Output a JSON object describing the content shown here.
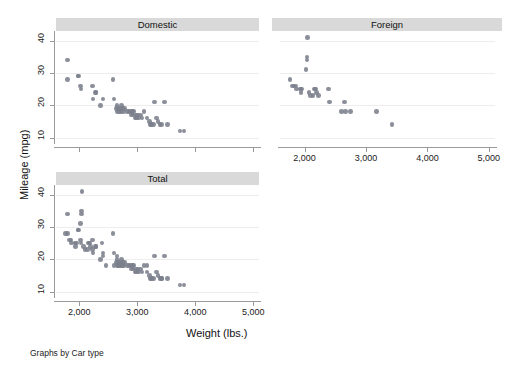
{
  "figure": {
    "y_axis_title": "Mileage (mpg)",
    "x_axis_title": "Weight (lbs.)",
    "note": "Graphs by Car type",
    "background_color": "#ffffff",
    "marker_color": "#7b7f8c",
    "panel_title_bg": "#d9d9d9",
    "axis_color": "#9a9a9a",
    "grid_color": "#ededed"
  },
  "panels": {
    "domestic": {
      "title": "Domestic"
    },
    "foreign": {
      "title": "Foreign"
    },
    "total": {
      "title": "Total"
    }
  },
  "axis_labels": {
    "y": [
      "10",
      "20",
      "30",
      "40"
    ],
    "x": [
      "2,000",
      "3,000",
      "4,000",
      "5,000"
    ]
  },
  "chart_data": {
    "type": "scatter",
    "title": "",
    "xlabel": "Weight (lbs.)",
    "ylabel": "Mileage (mpg)",
    "xlim": [
      1600,
      5100
    ],
    "ylim": [
      8,
      43
    ],
    "xticks": [
      2000,
      3000,
      4000,
      5000
    ],
    "yticks": [
      10,
      20,
      30,
      40
    ],
    "grid": "horizontal",
    "legend": "none",
    "note": "Graphs by Car type",
    "panel_variable": "Car type",
    "panels": [
      {
        "name": "Domestic",
        "points": [
          [
            1800,
            34
          ],
          [
            1800,
            28
          ],
          [
            1980,
            29
          ],
          [
            1990,
            29
          ],
          [
            2020,
            26
          ],
          [
            2030,
            25
          ],
          [
            2230,
            26
          ],
          [
            2240,
            22
          ],
          [
            2280,
            24
          ],
          [
            2290,
            24
          ],
          [
            2370,
            20
          ],
          [
            2410,
            22
          ],
          [
            2580,
            28
          ],
          [
            2600,
            22
          ],
          [
            2640,
            19
          ],
          [
            2650,
            20
          ],
          [
            2660,
            18
          ],
          [
            2670,
            19
          ],
          [
            2690,
            18
          ],
          [
            2700,
            19
          ],
          [
            2720,
            18
          ],
          [
            2730,
            20
          ],
          [
            2750,
            19
          ],
          [
            2760,
            18
          ],
          [
            2780,
            19
          ],
          [
            2830,
            18
          ],
          [
            2860,
            18
          ],
          [
            2890,
            18
          ],
          [
            2900,
            17
          ],
          [
            2920,
            18
          ],
          [
            2930,
            17
          ],
          [
            2940,
            18
          ],
          [
            2960,
            16
          ],
          [
            2980,
            17
          ],
          [
            2990,
            16
          ],
          [
            3010,
            17
          ],
          [
            3020,
            16
          ],
          [
            3060,
            17
          ],
          [
            3080,
            16
          ],
          [
            3120,
            18
          ],
          [
            3170,
            16
          ],
          [
            3210,
            15
          ],
          [
            3230,
            14
          ],
          [
            3250,
            14
          ],
          [
            3280,
            14
          ],
          [
            3300,
            21
          ],
          [
            3330,
            16
          ],
          [
            3360,
            15
          ],
          [
            3390,
            14
          ],
          [
            3420,
            14
          ],
          [
            3470,
            21
          ],
          [
            3520,
            14
          ],
          [
            3740,
            12
          ],
          [
            3810,
            12
          ]
        ]
      },
      {
        "name": "Foreign",
        "points": [
          [
            2050,
            41
          ],
          [
            2040,
            35
          ],
          [
            2040,
            34
          ],
          [
            2020,
            31
          ],
          [
            1760,
            28
          ],
          [
            1800,
            26
          ],
          [
            1830,
            26
          ],
          [
            1860,
            26
          ],
          [
            1870,
            25
          ],
          [
            1930,
            25
          ],
          [
            1940,
            24
          ],
          [
            1950,
            25
          ],
          [
            2070,
            24
          ],
          [
            2100,
            23
          ],
          [
            2140,
            23
          ],
          [
            2160,
            25
          ],
          [
            2180,
            25
          ],
          [
            2190,
            24
          ],
          [
            2230,
            23
          ],
          [
            2390,
            25
          ],
          [
            2410,
            21
          ],
          [
            2600,
            18
          ],
          [
            2650,
            21
          ],
          [
            2670,
            18
          ],
          [
            2750,
            18
          ],
          [
            3170,
            18
          ],
          [
            3420,
            14
          ]
        ]
      },
      {
        "name": "Total",
        "points": [
          [
            1760,
            28
          ],
          [
            1800,
            34
          ],
          [
            1800,
            28
          ],
          [
            1830,
            26
          ],
          [
            1860,
            26
          ],
          [
            1870,
            25
          ],
          [
            1930,
            25
          ],
          [
            1940,
            24
          ],
          [
            1950,
            25
          ],
          [
            1980,
            29
          ],
          [
            1990,
            29
          ],
          [
            2020,
            26
          ],
          [
            2020,
            31
          ],
          [
            2030,
            25
          ],
          [
            2040,
            35
          ],
          [
            2040,
            34
          ],
          [
            2050,
            41
          ],
          [
            2070,
            24
          ],
          [
            2100,
            23
          ],
          [
            2140,
            23
          ],
          [
            2160,
            25
          ],
          [
            2180,
            25
          ],
          [
            2190,
            24
          ],
          [
            2230,
            26
          ],
          [
            2230,
            23
          ],
          [
            2240,
            22
          ],
          [
            2280,
            24
          ],
          [
            2290,
            24
          ],
          [
            2370,
            20
          ],
          [
            2390,
            25
          ],
          [
            2410,
            22
          ],
          [
            2410,
            21
          ],
          [
            2460,
            18
          ],
          [
            2580,
            28
          ],
          [
            2600,
            22
          ],
          [
            2600,
            18
          ],
          [
            2640,
            19
          ],
          [
            2650,
            20
          ],
          [
            2650,
            21
          ],
          [
            2660,
            18
          ],
          [
            2670,
            19
          ],
          [
            2670,
            18
          ],
          [
            2690,
            18
          ],
          [
            2700,
            19
          ],
          [
            2720,
            18
          ],
          [
            2730,
            20
          ],
          [
            2750,
            19
          ],
          [
            2750,
            18
          ],
          [
            2760,
            18
          ],
          [
            2780,
            19
          ],
          [
            2830,
            18
          ],
          [
            2860,
            18
          ],
          [
            2890,
            18
          ],
          [
            2900,
            17
          ],
          [
            2920,
            18
          ],
          [
            2930,
            17
          ],
          [
            2940,
            18
          ],
          [
            2960,
            16
          ],
          [
            2980,
            17
          ],
          [
            2990,
            16
          ],
          [
            3010,
            17
          ],
          [
            3020,
            16
          ],
          [
            3060,
            17
          ],
          [
            3080,
            16
          ],
          [
            3120,
            18
          ],
          [
            3170,
            16
          ],
          [
            3170,
            18
          ],
          [
            3210,
            15
          ],
          [
            3230,
            14
          ],
          [
            3250,
            14
          ],
          [
            3280,
            14
          ],
          [
            3300,
            21
          ],
          [
            3330,
            16
          ],
          [
            3360,
            15
          ],
          [
            3390,
            14
          ],
          [
            3420,
            14
          ],
          [
            3420,
            14
          ],
          [
            3470,
            21
          ],
          [
            3520,
            14
          ],
          [
            3740,
            12
          ],
          [
            3810,
            12
          ]
        ]
      }
    ]
  }
}
